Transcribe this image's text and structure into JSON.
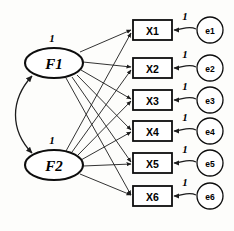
{
  "diagram": {
    "type": "sem-path-diagram",
    "background_color": "#fdfdfb",
    "stroke_color": "#1c1c1c",
    "shape_fill": "#ffffff",
    "factors": [
      {
        "id": "F1",
        "label": "F1",
        "variance_label": "1",
        "cx": 54,
        "cy": 63,
        "rx": 29,
        "ry": 15
      },
      {
        "id": "F2",
        "label": "F2",
        "variance_label": "1",
        "cx": 54,
        "cy": 165,
        "rx": 29,
        "ry": 15
      }
    ],
    "indicators": [
      {
        "id": "X1",
        "label": "X1",
        "x": 133,
        "y": 20,
        "w": 39,
        "h": 20
      },
      {
        "id": "X2",
        "label": "X2",
        "x": 133,
        "y": 58,
        "w": 39,
        "h": 20
      },
      {
        "id": "X3",
        "label": "X3",
        "x": 133,
        "y": 90,
        "w": 39,
        "h": 20
      },
      {
        "id": "X4",
        "label": "X4",
        "x": 133,
        "y": 121,
        "w": 39,
        "h": 20
      },
      {
        "id": "X5",
        "label": "X5",
        "x": 133,
        "y": 153,
        "w": 39,
        "h": 20
      },
      {
        "id": "X6",
        "label": "X6",
        "x": 133,
        "y": 186,
        "w": 39,
        "h": 20
      }
    ],
    "errors": [
      {
        "id": "e1",
        "label": "e1",
        "cx": 210,
        "cy": 30,
        "r": 13,
        "path_label": "1"
      },
      {
        "id": "e2",
        "label": "e2",
        "cx": 210,
        "cy": 68,
        "r": 13,
        "path_label": "1"
      },
      {
        "id": "e3",
        "label": "e3",
        "cx": 210,
        "cy": 100,
        "r": 13,
        "path_label": "1"
      },
      {
        "id": "e4",
        "label": "e4",
        "cx": 210,
        "cy": 131,
        "r": 13,
        "path_label": "1"
      },
      {
        "id": "e5",
        "label": "e5",
        "cx": 210,
        "cy": 163,
        "r": 13,
        "path_label": "1"
      },
      {
        "id": "e6",
        "label": "e6",
        "cx": 210,
        "cy": 196,
        "r": 13,
        "path_label": "1"
      }
    ],
    "loadings": [
      {
        "from": "F1",
        "to": "X1"
      },
      {
        "from": "F1",
        "to": "X2"
      },
      {
        "from": "F1",
        "to": "X3"
      },
      {
        "from": "F1",
        "to": "X4"
      },
      {
        "from": "F1",
        "to": "X5"
      },
      {
        "from": "F1",
        "to": "X6"
      },
      {
        "from": "F2",
        "to": "X1"
      },
      {
        "from": "F2",
        "to": "X2"
      },
      {
        "from": "F2",
        "to": "X3"
      },
      {
        "from": "F2",
        "to": "X4"
      },
      {
        "from": "F2",
        "to": "X5"
      },
      {
        "from": "F2",
        "to": "X6"
      }
    ],
    "covariance": {
      "from": "F1",
      "to": "F2",
      "style": "curved-double-arrow"
    },
    "variance_labels": {
      "f1_label": "1",
      "f2_label": "1"
    }
  }
}
